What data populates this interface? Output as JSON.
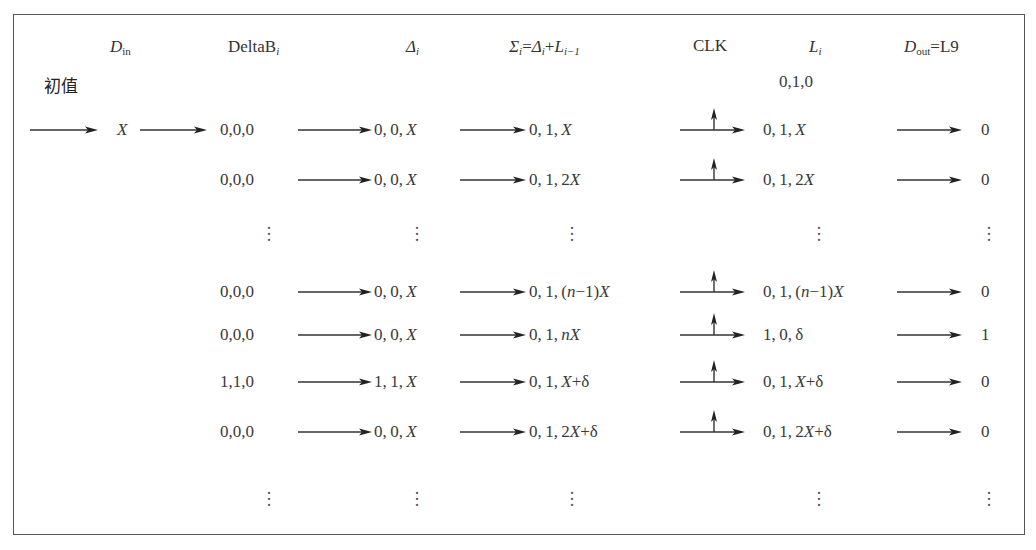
{
  "headers": {
    "din": {
      "base": "D",
      "sub": "in"
    },
    "deltab": {
      "base": "DeltaB",
      "sub": "i"
    },
    "delta": {
      "base": "Δ",
      "sub": "i"
    },
    "sigma": {
      "text": "Σ",
      "sub": "i",
      "eq": "=",
      "d": "Δ",
      "dsub": "i",
      "plus": "+",
      "l": "L",
      "lsub": "i−1"
    },
    "clk": "CLK",
    "li": {
      "base": "L",
      "sub": "i"
    },
    "dout": {
      "base": "D",
      "sub": "out",
      "eq": "=L9"
    }
  },
  "initial": {
    "label": "初值",
    "l0": "0,1,0"
  },
  "rows": [
    {
      "din": "X",
      "deltab": "0,0,0",
      "delta": "0,0,X",
      "sigma": "0,1,X",
      "clk": true,
      "li": "0,1,X",
      "dout": "0"
    },
    {
      "din": "",
      "deltab": "0,0,0",
      "delta": "0,0,X",
      "sigma": "0,1,2X",
      "clk": true,
      "li": "0,1,2X",
      "dout": "0"
    },
    {
      "ellipsis": true
    },
    {
      "din": "",
      "deltab": "0,0,0",
      "delta": "0,0,X",
      "sigma": "0,1,(n−1)X",
      "clk": true,
      "li": "0,1,(n−1)X",
      "dout": "0"
    },
    {
      "din": "",
      "deltab": "0,0,0",
      "delta": "0,0,X",
      "sigma": "0,1,nX",
      "clk": true,
      "li": "1,0,δ",
      "dout": "1"
    },
    {
      "din": "",
      "deltab": "1,1,0",
      "delta": "1,1,X",
      "sigma": "0,1,X+δ",
      "clk": true,
      "li": "0,1,X+δ",
      "dout": "0"
    },
    {
      "din": "",
      "deltab": "0,0,0",
      "delta": "0,0,X",
      "sigma": "0,1,2X+δ",
      "clk": true,
      "li": "0,1,2X+δ",
      "dout": "0"
    },
    {
      "ellipsis": true
    }
  ],
  "colors": {
    "ink": "#333333",
    "border": "#555555",
    "background": "#ffffff"
  }
}
